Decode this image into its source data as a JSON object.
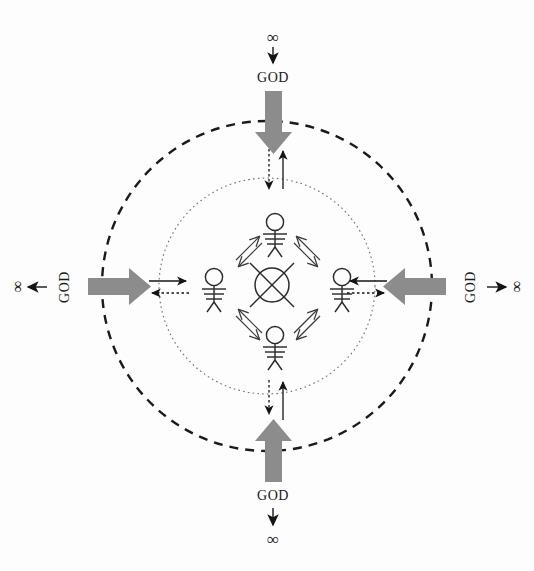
{
  "diagram": {
    "background_color": "#fdfdfd",
    "ink_color": "#1a1a1a",
    "gray_arrow_color": "#8c8c8c",
    "outer_circle": {
      "style": "dashed",
      "color": "#1a1a1a",
      "cx": 267,
      "cy": 286,
      "r": 165
    },
    "inner_circle": {
      "style": "dotted",
      "color": "#6e6e6e",
      "cx": 267,
      "cy": 286,
      "r": 108
    },
    "center_symbol": {
      "name": "crossed-circle",
      "label": ""
    },
    "labels": {
      "god": "GOD",
      "infinity": "∞"
    },
    "cardinals": [
      {
        "id": "top",
        "god_text": "GOD",
        "infinity_text": "∞",
        "inflow_direction": "down",
        "outflow_direction": "up",
        "god_rotation": 0
      },
      {
        "id": "left",
        "god_text": "GOD",
        "infinity_text": "∞",
        "inflow_direction": "right",
        "outflow_direction": "left",
        "god_rotation": -90
      },
      {
        "id": "right",
        "god_text": "GOD",
        "infinity_text": "∞",
        "inflow_direction": "left",
        "outflow_direction": "right",
        "god_rotation": -90
      },
      {
        "id": "bottom",
        "god_text": "GOD",
        "infinity_text": "∞",
        "inflow_direction": "up",
        "outflow_direction": "down",
        "god_rotation": 0
      }
    ],
    "figures": [
      {
        "id": "figure-north",
        "name": "person-top",
        "x": 275,
        "y": 232
      },
      {
        "id": "figure-west",
        "name": "person-left",
        "x": 214,
        "y": 288
      },
      {
        "id": "figure-east",
        "name": "person-right",
        "x": 342,
        "y": 288
      },
      {
        "id": "figure-south",
        "name": "person-bottom",
        "x": 275,
        "y": 345
      }
    ],
    "exchanges": [
      {
        "id": "exchange-nw",
        "between": [
          "person-top",
          "person-left"
        ]
      },
      {
        "id": "exchange-ne",
        "between": [
          "person-top",
          "person-right"
        ]
      },
      {
        "id": "exchange-sw",
        "between": [
          "person-bottom",
          "person-left"
        ]
      },
      {
        "id": "exchange-se",
        "between": [
          "person-bottom",
          "person-right"
        ]
      }
    ],
    "boundary_arrow_pairs": [
      {
        "id": "boundary-top",
        "solid_direction": "up",
        "dotted_direction": "down"
      },
      {
        "id": "boundary-left",
        "solid_direction": "right",
        "dotted_direction": "left"
      },
      {
        "id": "boundary-right",
        "solid_direction": "left",
        "dotted_direction": "right"
      },
      {
        "id": "boundary-bottom",
        "solid_direction": "up",
        "dotted_direction": "down"
      }
    ]
  }
}
